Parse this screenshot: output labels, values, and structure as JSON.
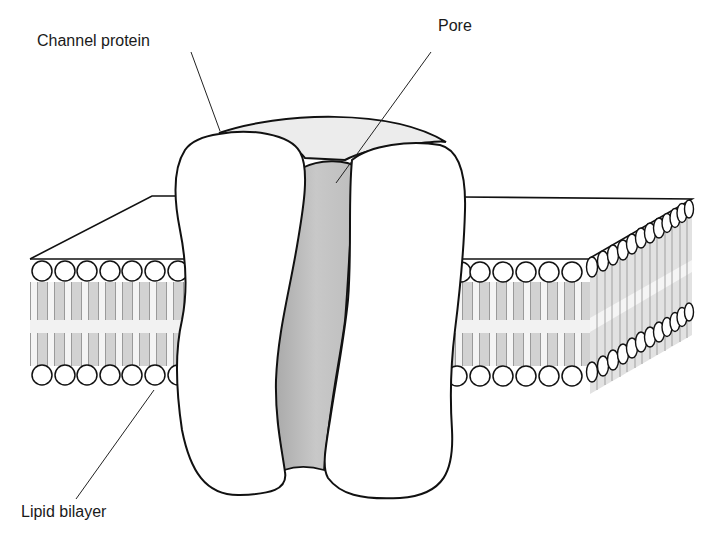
{
  "figure": {
    "type": "channel-protein-diagram",
    "labels": {
      "channel_protein": "Channel protein",
      "pore": "Pore",
      "lipid_bilayer": "Lipid bilayer"
    },
    "colors": {
      "outline": "#111111",
      "pore_fill": "#c4c4c4",
      "pore_top_fill": "#b8b8b8",
      "protein_top_fill": "#ececec",
      "lipid_tail_fill": "#d6d6d6",
      "background": "#ffffff"
    },
    "bilayer": {
      "front_heads_per_row_left": 7,
      "front_heads_per_row_right": 6,
      "side_heads_per_row": 14
    }
  }
}
